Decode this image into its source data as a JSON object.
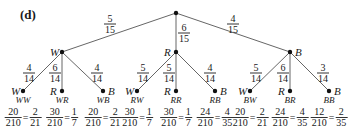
{
  "panel_label": "(d)",
  "root": {
    "x": 176,
    "y": 13
  },
  "branches_level1": [
    {
      "label": "W",
      "x": 62,
      "y": 52,
      "prob": {
        "num": "5",
        "den": "15"
      },
      "prob_pos": [
        110,
        24
      ]
    },
    {
      "label": "R",
      "x": 176,
      "y": 52,
      "prob": {
        "num": "6",
        "den": "15"
      },
      "prob_pos": [
        184,
        33
      ]
    },
    {
      "label": "B",
      "x": 290,
      "y": 52,
      "prob": {
        "num": "4",
        "den": "15"
      },
      "prob_pos": [
        233,
        24
      ]
    }
  ],
  "leaves": [
    {
      "label": "W",
      "outcome": "WW",
      "x": 23,
      "prob": {
        "num": "4",
        "den": "14"
      },
      "prob_pos": [
        29,
        73
      ],
      "result": {
        "num": "20",
        "den": "210",
        "snum": "2",
        "sden": "21"
      }
    },
    {
      "label": "R",
      "outcome": "WR",
      "x": 62,
      "prob": {
        "num": "6",
        "den": "14"
      },
      "prob_pos": [
        55,
        73
      ],
      "result": {
        "num": "30",
        "den": "210",
        "snum": "1",
        "sden": "7"
      }
    },
    {
      "label": "B",
      "outcome": "WB",
      "x": 103,
      "prob": {
        "num": "4",
        "den": "14"
      },
      "prob_pos": [
        97,
        73
      ],
      "result": {
        "num": "20",
        "den": "210",
        "snum": "2",
        "sden": "21"
      }
    },
    {
      "label": "W",
      "outcome": "RW",
      "x": 137,
      "prob": {
        "num": "5",
        "den": "14"
      },
      "prob_pos": [
        143,
        73
      ],
      "result": {
        "num": "30",
        "den": "210",
        "snum": "1",
        "sden": "7"
      }
    },
    {
      "label": "R",
      "outcome": "RR",
      "x": 176,
      "prob": {
        "num": "5",
        "den": "14"
      },
      "prob_pos": [
        169,
        73
      ],
      "result": {
        "num": "30",
        "den": "210",
        "snum": "1",
        "sden": "7"
      }
    },
    {
      "label": "B",
      "outcome": "RB",
      "x": 215,
      "prob": {
        "num": "4",
        "den": "14"
      },
      "prob_pos": [
        210,
        73
      ],
      "result": {
        "num": "24",
        "den": "210",
        "snum": "4",
        "sden": "35"
      }
    },
    {
      "label": "W",
      "outcome": "BW",
      "x": 250,
      "prob": {
        "num": "5",
        "den": "14"
      },
      "prob_pos": [
        256,
        73
      ],
      "result": {
        "num": "20",
        "den": "210",
        "snum": "2",
        "sden": "21"
      }
    },
    {
      "label": "R",
      "outcome": "BR",
      "x": 290,
      "prob": {
        "num": "6",
        "den": "14"
      },
      "prob_pos": [
        283,
        73
      ],
      "result": {
        "num": "24",
        "den": "210",
        "snum": "4",
        "sden": "35"
      }
    },
    {
      "label": "B",
      "outcome": "BB",
      "x": 329,
      "prob": {
        "num": "3",
        "den": "14"
      },
      "prob_pos": [
        323,
        73
      ],
      "result": {
        "num": "12",
        "den": "210",
        "snum": "2",
        "sden": "35"
      }
    }
  ],
  "leaf_y": 91,
  "equals_sign": "=",
  "colors": {
    "line": "#555555",
    "node": "#111111",
    "text": "#1a1a1a"
  }
}
